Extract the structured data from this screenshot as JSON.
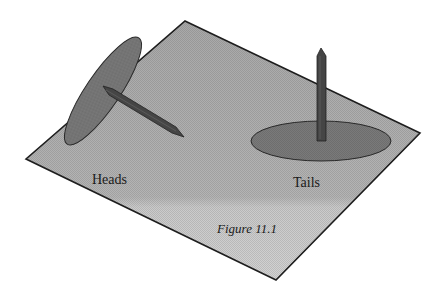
{
  "figure": {
    "caption": "Figure 11.1",
    "labels": {
      "heads": "Heads",
      "tails": "Tails"
    },
    "elements": [
      {
        "name": "plane",
        "description": "tilted gray plane"
      },
      {
        "name": "heads-tack",
        "description": "thumbtack lying on its side (disc vertical, pin pointing down-right)"
      },
      {
        "name": "tails-tack",
        "description": "thumbtack resting on its disc, pin pointing up"
      }
    ],
    "colors": {
      "plane_top": "#a9a9a9",
      "plane_bottom": "#cfcfcf",
      "disc": "#7a7a7a",
      "pin": "#454545",
      "outline": "#222222"
    }
  }
}
